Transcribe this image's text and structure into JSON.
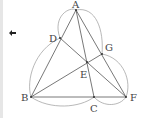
{
  "diagram": {
    "nav_icon": "left-arrow-icon",
    "points": {
      "A": {
        "x": 76,
        "y": 10,
        "label": "A",
        "lx": 72,
        "ly": 8
      },
      "D": {
        "x": 60,
        "y": 38,
        "label": "D",
        "lx": 49,
        "ly": 42
      },
      "G": {
        "x": 102,
        "y": 54,
        "label": "G",
        "lx": 105,
        "ly": 51
      },
      "E": {
        "x": 87,
        "y": 62,
        "label": "E",
        "lx": 80,
        "ly": 78
      },
      "B": {
        "x": 31,
        "y": 97,
        "label": "B",
        "lx": 21,
        "ly": 101
      },
      "C": {
        "x": 94,
        "y": 97,
        "label": "C",
        "lx": 90,
        "ly": 112
      },
      "F": {
        "x": 126,
        "y": 97,
        "label": "F",
        "lx": 130,
        "ly": 101
      }
    },
    "labels": [
      "A",
      "D",
      "G",
      "E",
      "B",
      "C",
      "F"
    ],
    "segments": [
      [
        "A",
        "B"
      ],
      [
        "A",
        "C"
      ],
      [
        "A",
        "F"
      ],
      [
        "B",
        "F"
      ],
      [
        "B",
        "G"
      ],
      [
        "D",
        "F"
      ]
    ],
    "line_color": "#555555",
    "arc_color": "#999999"
  }
}
